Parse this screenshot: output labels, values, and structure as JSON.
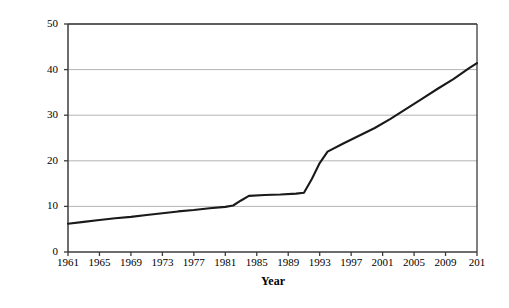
{
  "chart_data": {
    "type": "line",
    "title": "",
    "xlabel": "Year",
    "ylabel": "Woodfuel production (millions\nof tonnes)",
    "ylim": [
      0,
      50
    ],
    "xlim": [
      1961,
      2013
    ],
    "yticks": [
      0,
      10,
      20,
      30,
      40,
      50
    ],
    "xticks": [
      1961,
      1965,
      1969,
      1973,
      1977,
      1981,
      1985,
      1989,
      1993,
      1997,
      2001,
      2005,
      2009,
      2013
    ],
    "xtick_labels": [
      "1961",
      "1965",
      "1969",
      "1973",
      "1977",
      "1981",
      "1985",
      "1989",
      "1993",
      "1997",
      "2001",
      "2005",
      "2009",
      "201"
    ],
    "grid": "horizontal",
    "legend": null,
    "line_color": "#1a1a1a",
    "grid_color": "#b4b4b4",
    "axis_color": "#3c3c3c",
    "background": "#ffffff",
    "series": [
      {
        "name": "Woodfuel production",
        "x": [
          1961,
          1963,
          1965,
          1967,
          1969,
          1971,
          1973,
          1975,
          1977,
          1979,
          1981,
          1982,
          1983,
          1984,
          1986,
          1988,
          1990,
          1991,
          1992,
          1993,
          1994,
          1996,
          1998,
          2000,
          2002,
          2004,
          2006,
          2008,
          2010,
          2012,
          2013
        ],
        "values": [
          6.2,
          6.6,
          7.0,
          7.4,
          7.7,
          8.1,
          8.5,
          8.9,
          9.2,
          9.6,
          9.9,
          10.2,
          11.3,
          12.3,
          12.5,
          12.6,
          12.8,
          13.0,
          16.0,
          19.5,
          22.0,
          23.8,
          25.5,
          27.2,
          29.2,
          31.4,
          33.6,
          35.8,
          37.9,
          40.3,
          41.4
        ]
      }
    ]
  }
}
